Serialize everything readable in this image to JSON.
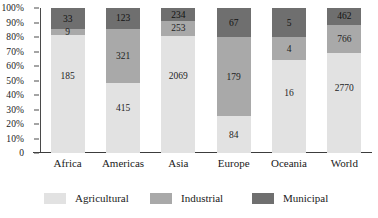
{
  "chart_data": {
    "type": "bar",
    "stacked": true,
    "normalized": "100%",
    "title": "",
    "subtitle": "",
    "xlabel": "",
    "ylabel": "",
    "categories": [
      "Africa",
      "Americas",
      "Asia",
      "Europe",
      "Oceania",
      "World"
    ],
    "series": [
      {
        "name": "Agricultural",
        "color": "#e2e2e2",
        "values": [
          185,
          415,
          2069,
          84,
          16,
          2770
        ]
      },
      {
        "name": "Industrial",
        "color": "#a9a9a9",
        "values": [
          9,
          321,
          253,
          179,
          4,
          766
        ]
      },
      {
        "name": "Municipal",
        "color": "#6f6f6f",
        "values": [
          33,
          123,
          234,
          67,
          5,
          462
        ]
      }
    ],
    "yticks": [
      "100%",
      "90%",
      "80%",
      "70%",
      "60%",
      "50%",
      "40%",
      "30%",
      "20%",
      "10%",
      "0"
    ],
    "ylim": [
      0,
      100
    ],
    "grid": false,
    "legend_position": "bottom",
    "legend": [
      {
        "label": "Agricultural",
        "color": "#e2e2e2"
      },
      {
        "label": "Industrial",
        "color": "#a9a9a9"
      },
      {
        "label": "Municipal",
        "color": "#6f6f6f"
      }
    ]
  }
}
